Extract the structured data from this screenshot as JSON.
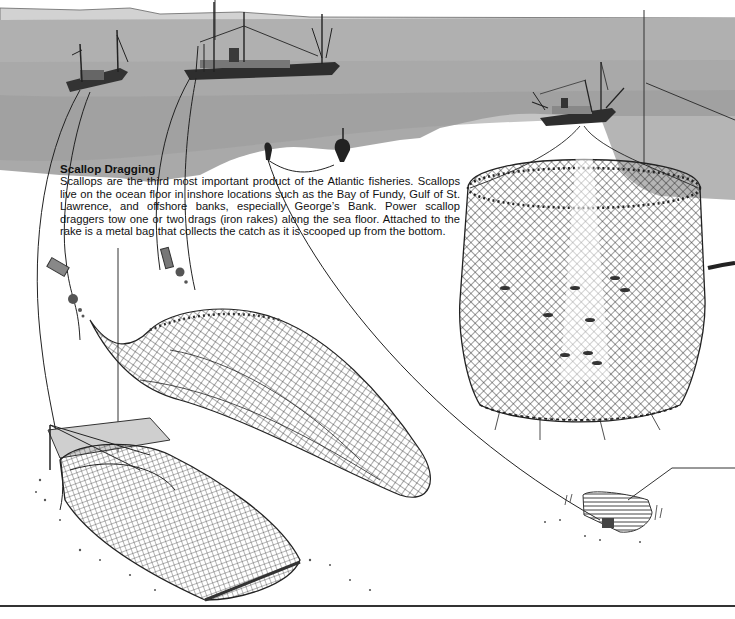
{
  "illustration": {
    "subject": "Atlantic fishing methods: scallop dragging, purse seine, lobster trap",
    "colors": {
      "sea": "#a9a9a9",
      "sea_light": "#bdbdbd",
      "land_horizon": "#c8c8c8",
      "net": "#2a2a2a",
      "paper": "#ffffff",
      "ink": "#111111"
    },
    "elements": [
      {
        "name": "trawler-small",
        "label": "small dragger vessel"
      },
      {
        "name": "trawler-large",
        "label": "large dragger vessel"
      },
      {
        "name": "seiner-vessel",
        "label": "purse seine vessel"
      },
      {
        "name": "buoys",
        "label": "marker buoys"
      },
      {
        "name": "scallop-drag-net",
        "label": "scallop drag net"
      },
      {
        "name": "scallop-rake",
        "label": "iron rake with metal bag"
      },
      {
        "name": "purse-seine-net",
        "label": "cylindrical purse seine"
      },
      {
        "name": "lobster-trap",
        "label": "lobster trap"
      }
    ]
  },
  "top_right_fragment": "catch fishing near shore on both coasts.",
  "caption": {
    "title": "Scallop Dragging",
    "body": "Scallops are the third most important product of the Atlantic fisheries. Scallops live on the ocean floor in inshore locations such as the Bay of Fundy, Gulf of St. Lawrence, and offshore banks, especially George’s Bank. Power scallop draggers tow one or two drags (iron rakes) along the sea floor. Attached to the rake is a metal bag that collects the catch as it is scooped up from the bottom."
  }
}
